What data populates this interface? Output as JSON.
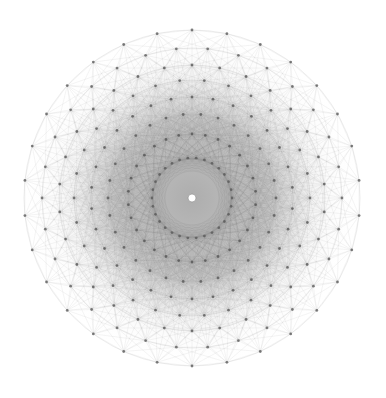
{
  "figure": {
    "symmetry_order": 30,
    "background": "#ffffff",
    "center": [
      192,
      198
    ],
    "rings": [
      {
        "radius": 168,
        "phase_deg": 0,
        "vertex_color": "#555555"
      },
      {
        "radius": 150,
        "phase_deg": 6,
        "vertex_color": "#5a5a5a"
      },
      {
        "radius": 133,
        "phase_deg": 0,
        "vertex_color": "#555555"
      },
      {
        "radius": 118,
        "phase_deg": 6,
        "vertex_color": "#5a5a5a"
      },
      {
        "radius": 101,
        "phase_deg": 0,
        "vertex_color": "#555555"
      },
      {
        "radius": 84,
        "phase_deg": 6,
        "vertex_color": "#5a5a5a"
      },
      {
        "radius": 64,
        "phase_deg": 0,
        "vertex_color": "#555555"
      },
      {
        "radius": 40,
        "phase_deg": 6,
        "vertex_color": "#5a5a5a"
      }
    ],
    "edge_color": "#777777",
    "center_hole_color": "#ffffff"
  }
}
